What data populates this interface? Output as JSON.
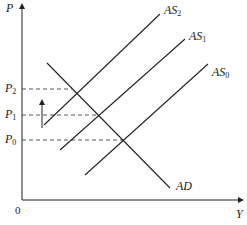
{
  "diagram": {
    "axes": {
      "y_label": "P",
      "x_label": "Y",
      "origin_label": "0"
    },
    "price_levels": [
      {
        "id": "P2",
        "base": "P",
        "sub": "2",
        "y": 89
      },
      {
        "id": "P1",
        "base": "P",
        "sub": "1",
        "y": 115
      },
      {
        "id": "P0",
        "base": "P",
        "sub": "0",
        "y": 140
      }
    ],
    "curves": [
      {
        "id": "AS2",
        "base": "AS",
        "sub": "2",
        "x1": 44,
        "y1": 125,
        "x2": 160,
        "y2": 14
      },
      {
        "id": "AS1",
        "base": "AS",
        "sub": "1",
        "x1": 60,
        "y1": 150,
        "x2": 185,
        "y2": 39
      },
      {
        "id": "AS0",
        "base": "AS",
        "sub": "0",
        "x1": 85,
        "y1": 175,
        "x2": 208,
        "y2": 64
      },
      {
        "id": "AD",
        "base": "AD",
        "sub": "",
        "x1": 47,
        "y1": 63,
        "x2": 170,
        "y2": 188
      }
    ],
    "equilibria": [
      {
        "curve": "AS2",
        "x": 72,
        "y": 89
      },
      {
        "curve": "AS1",
        "x": 99,
        "y": 115
      },
      {
        "curve": "AS0",
        "x": 124,
        "y": 140
      }
    ],
    "shift_arrow": {
      "direction": "up",
      "x": 42,
      "y_from": 128,
      "y_to": 100
    },
    "colors": {
      "line": "#222222",
      "dashed": "#444444",
      "background": "#ffffff"
    }
  }
}
